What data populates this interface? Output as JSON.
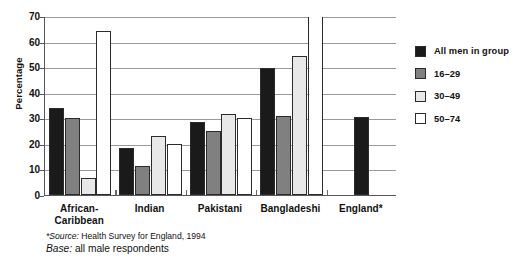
{
  "chart_data": {
    "type": "bar",
    "title": "",
    "xlabel": "",
    "ylabel": "Percentage",
    "ylim": [
      0,
      70
    ],
    "yticks": [
      0,
      10,
      20,
      30,
      40,
      50,
      60,
      70
    ],
    "grid": true,
    "legend_position": "right",
    "categories": [
      "African-Caribbean",
      "Indian",
      "Pakistani",
      "Bangladeshi",
      "England*"
    ],
    "series": [
      {
        "name": "All men in group",
        "color": "#1a1a1a",
        "values": [
          34.0,
          18.5,
          28.5,
          49.5,
          30.5
        ]
      },
      {
        "name": "16–29",
        "color": "#808080",
        "values": [
          30.3,
          11.5,
          25.0,
          31.0,
          null
        ]
      },
      {
        "name": "30–49",
        "color": "#e8e8e8",
        "values": [
          6.7,
          23.0,
          31.5,
          54.5,
          null
        ]
      },
      {
        "name": "50–74",
        "color": "#ffffff",
        "values": [
          64.0,
          20.0,
          30.3,
          71.5,
          null
        ]
      }
    ],
    "notes": [
      "*Source: Health Survey for England, 1994",
      "Base: all male respondents"
    ]
  },
  "axis": {
    "y_title": "Percentage",
    "y_tick_labels": [
      "70",
      "60",
      "50",
      "40",
      "30",
      "20",
      "10",
      "0"
    ]
  },
  "legend": {
    "items": [
      {
        "label": "All men in group"
      },
      {
        "label": "16–29"
      },
      {
        "label": "30–49"
      },
      {
        "label": "50–74"
      }
    ]
  },
  "categories": {
    "items": [
      {
        "line1": "African-",
        "line2": "Caribbean"
      },
      {
        "line1": "Indian",
        "line2": ""
      },
      {
        "line1": "Pakistani",
        "line2": ""
      },
      {
        "line1": "Bangladeshi",
        "line2": ""
      },
      {
        "line1": "England*",
        "line2": ""
      }
    ]
  },
  "footnotes": {
    "source_lead": "*Source:",
    "source_text": " Health Survey for England, 1994",
    "base_lead": "Base:",
    "base_text": " all male respondents"
  }
}
